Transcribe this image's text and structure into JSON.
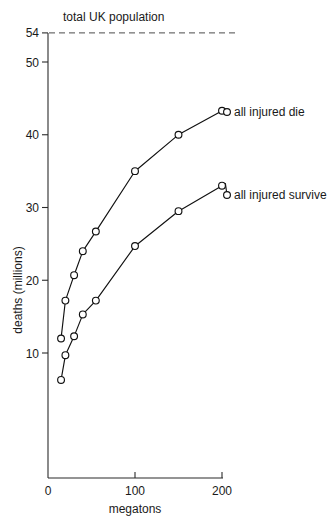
{
  "chart_data": {
    "type": "line",
    "title": "",
    "xlabel": "megatons",
    "ylabel": "deaths (millions)",
    "xlim": [
      0,
      215
    ],
    "ylim": [
      0,
      55
    ],
    "xticks": [
      "0",
      "100",
      "200"
    ],
    "xtick_values": [
      0,
      100,
      200
    ],
    "yticks": [
      "10",
      "20",
      "30",
      "40",
      "50",
      "54"
    ],
    "ytick_values": [
      10,
      20,
      30,
      40,
      50,
      54
    ],
    "grid": false,
    "legend": "inline-end-labels",
    "annotations": [
      {
        "name": "total-uk-population",
        "label": "total UK population",
        "type": "horizontal-dashed-line",
        "value": 54
      }
    ],
    "series": [
      {
        "name": "all injured die",
        "x": [
          15,
          20,
          30,
          40,
          55,
          100,
          150,
          200
        ],
        "values": [
          12.0,
          17.2,
          20.7,
          24.0,
          26.7,
          35.0,
          40.0,
          43.3
        ]
      },
      {
        "name": "all injured survive",
        "x": [
          15,
          20,
          30,
          40,
          55,
          100,
          150,
          200
        ],
        "values": [
          6.3,
          9.7,
          12.3,
          15.3,
          17.2,
          24.7,
          29.5,
          33.0
        ]
      }
    ]
  },
  "colors": {
    "line": "#111111",
    "marker_fill": "#ffffff",
    "axis": "#2b2b2b",
    "reference_line": "#4a4a4a",
    "background": "#ffffff"
  }
}
